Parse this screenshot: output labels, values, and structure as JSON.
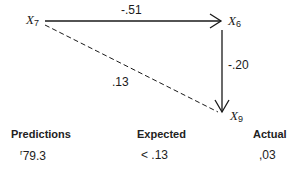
{
  "diagram": {
    "nodes": [
      {
        "id": "x7",
        "base": "X",
        "sub": "7"
      },
      {
        "id": "x6",
        "base": "X",
        "sub": "6"
      },
      {
        "id": "x9",
        "base": "X",
        "sub": "9"
      }
    ],
    "edges": [
      {
        "from": "x7",
        "to": "x6",
        "label": "-.51",
        "style": "solid"
      },
      {
        "from": "x6",
        "to": "x9",
        "label": "-.20",
        "style": "solid"
      },
      {
        "from": "x7",
        "to": "x9",
        "label": ".13",
        "style": "dashed"
      }
    ]
  },
  "table": {
    "headers": [
      "Predictions",
      "Expected",
      "Actual"
    ],
    "values": {
      "prediction_mark": "r",
      "prediction": "79.3",
      "expected": "< .13",
      "actual": ",03"
    }
  }
}
